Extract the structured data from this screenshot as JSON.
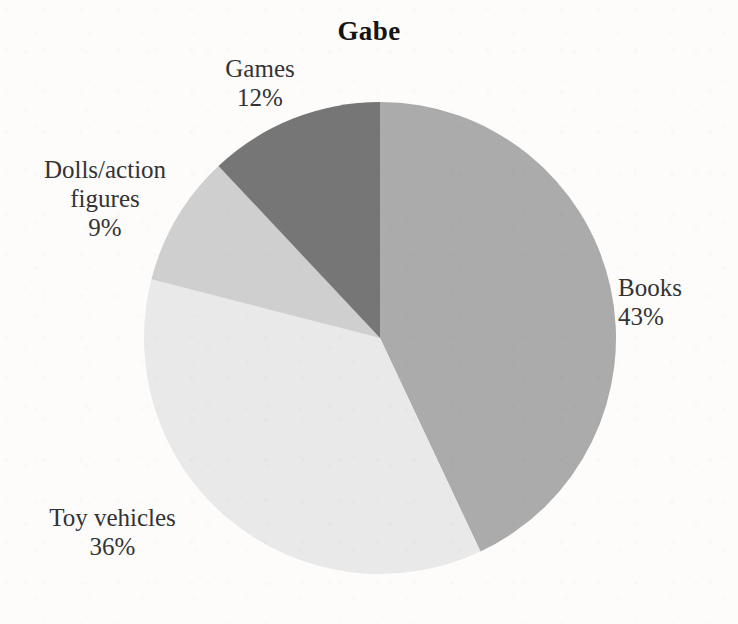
{
  "chart_data": {
    "type": "pie",
    "title": "Gabe",
    "xlabel": "",
    "ylabel": "",
    "categories": [
      "Books",
      "Toy vehicles",
      "Dolls/action figures",
      "Games"
    ],
    "values": [
      43,
      36,
      9,
      12
    ],
    "unit": "%",
    "slices": [
      {
        "label": "Books",
        "value": 43,
        "value_text": "43%",
        "color": "#ababab",
        "start_angle_deg": 0,
        "end_angle_deg": 154.8,
        "label_position": "right"
      },
      {
        "label": "Toy vehicles",
        "value": 36,
        "value_text": "36%",
        "color": "#e9e9e9",
        "start_angle_deg": 154.8,
        "end_angle_deg": 284.4,
        "label_position": "bottom-left"
      },
      {
        "label": "Dolls/action figures",
        "value": 9,
        "value_text": "9%",
        "color": "#cfcfcf",
        "start_angle_deg": 284.4,
        "end_angle_deg": 316.8,
        "label_position": "left"
      },
      {
        "label": "Games",
        "value": 12,
        "value_text": "12%",
        "color": "#767676",
        "start_angle_deg": 316.8,
        "end_angle_deg": 360,
        "label_position": "top-left"
      }
    ],
    "legend": "none",
    "grid": false,
    "start_angle_note": "first slice begins at 12 o'clock, drawn clockwise",
    "background_color": "#fdfcfb",
    "text_color": "#333333",
    "title_color": "#141414"
  },
  "labels": {
    "games": {
      "name": "Games",
      "pct": "12%"
    },
    "dolls": {
      "name": "Dolls/action figures",
      "pct": "9%"
    },
    "toy": {
      "name": "Toy vehicles",
      "pct": "36%"
    },
    "books": {
      "name": "Books",
      "pct": "43%"
    }
  }
}
